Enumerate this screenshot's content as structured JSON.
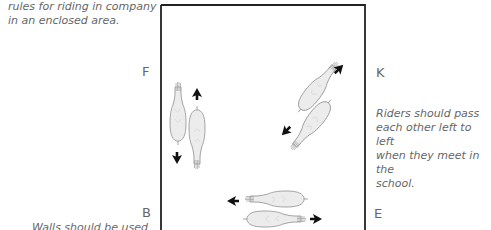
{
  "captions": {
    "top_left": [
      "rules for riding in company",
      "in an enclosed area."
    ],
    "right": [
      "Riders should pass",
      "each other left to left",
      "when they meet in the",
      "school."
    ],
    "bottom_left": "Walls should be used"
  },
  "markers": {
    "F": "F",
    "K": "K",
    "B": "B",
    "E": "E"
  },
  "colors": {
    "arena_border": "#222222",
    "horse_fill": "#ececec",
    "horse_outline": "#9a9a9a",
    "arrow": "#111111",
    "text": "#666666"
  }
}
